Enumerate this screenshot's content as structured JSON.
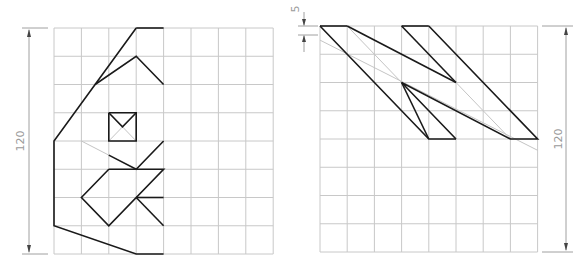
{
  "left_panel": {
    "dimension_label": "120",
    "grid": {
      "cols": 8,
      "rows": 8
    },
    "bold_paths": [
      [
        [
          3,
          0
        ],
        [
          4,
          0
        ]
      ],
      [
        [
          3,
          0
        ],
        [
          0,
          4
        ],
        [
          0,
          7
        ],
        [
          3,
          8
        ],
        [
          4,
          8
        ]
      ],
      [
        [
          1.5,
          2
        ],
        [
          3,
          1
        ],
        [
          4,
          2
        ]
      ],
      [
        [
          2,
          3
        ],
        [
          3,
          3
        ],
        [
          3,
          4
        ],
        [
          2,
          4
        ],
        [
          2,
          3
        ]
      ],
      [
        [
          2,
          3
        ],
        [
          2.5,
          3.5
        ],
        [
          3,
          3
        ]
      ],
      [
        [
          2,
          4.5
        ],
        [
          3,
          5
        ],
        [
          4,
          4
        ]
      ],
      [
        [
          2,
          5
        ],
        [
          4,
          5
        ],
        [
          2,
          7
        ],
        [
          1,
          6
        ],
        [
          2,
          5
        ]
      ],
      [
        [
          3,
          6
        ],
        [
          4,
          6
        ]
      ],
      [
        [
          3,
          6
        ],
        [
          4,
          7
        ]
      ]
    ],
    "thin_paths": [
      [
        [
          2,
          4
        ],
        [
          2.5,
          3.5
        ],
        [
          3,
          4
        ]
      ],
      [
        [
          1,
          4
        ],
        [
          2,
          4.5
        ]
      ]
    ]
  },
  "right_panel": {
    "dimension_label": "120",
    "offset_label": "5",
    "grid": {
      "cols": 8,
      "rows": 8
    },
    "bold_paths": [
      [
        [
          0,
          0
        ],
        [
          1,
          0
        ]
      ],
      [
        [
          0,
          0
        ],
        [
          4,
          4
        ],
        [
          5,
          4
        ]
      ],
      [
        [
          1,
          0
        ],
        [
          5,
          2
        ]
      ],
      [
        [
          3,
          0
        ],
        [
          4,
          0
        ]
      ],
      [
        [
          3,
          0
        ],
        [
          5,
          2
        ]
      ],
      [
        [
          4,
          0
        ],
        [
          8,
          4
        ],
        [
          7,
          4
        ],
        [
          3,
          2
        ],
        [
          5,
          4
        ]
      ],
      [
        [
          3,
          2
        ],
        [
          4,
          4
        ]
      ]
    ],
    "thin_paths": [
      [
        [
          0,
          0.5
        ],
        [
          8,
          4.4
        ]
      ],
      [
        [
          1,
          0
        ],
        [
          3,
          2
        ]
      ],
      [
        [
          5,
          2
        ],
        [
          7,
          4
        ]
      ]
    ]
  }
}
